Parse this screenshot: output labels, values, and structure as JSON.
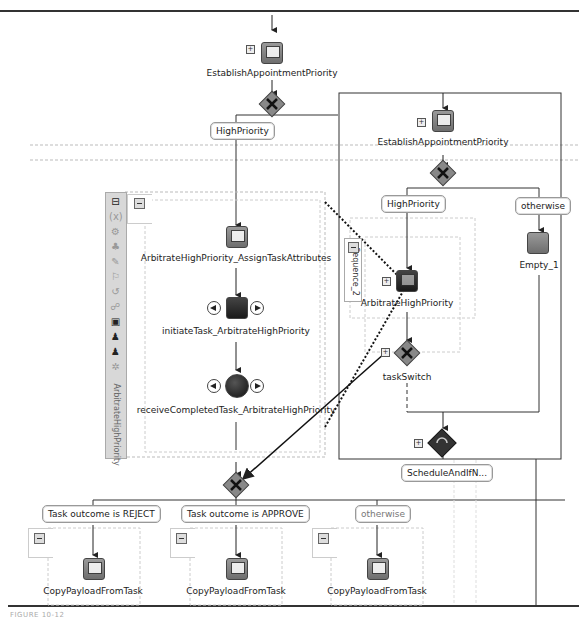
{
  "diagram": {
    "top_activity": {
      "label": "EstablishAppointmentPriority",
      "type": "invoke"
    },
    "top_switch_case": "HighPriority",
    "left_scope": {
      "name": "ArbitrateHighPriority",
      "activities": [
        {
          "label": "ArbitrateHighPriority_AssignTaskAttributes",
          "type": "assign"
        },
        {
          "label": "initiateTask_ArbitrateHighPriority",
          "type": "invoke"
        },
        {
          "label": "receiveCompletedTask_ArbitrateHighPriority",
          "type": "receive"
        }
      ],
      "toolbar_icons": [
        "collapse-icon",
        "variables-icon",
        "correlation-icon",
        "partner-links-icon",
        "message-exchange-icon",
        "fault-handlers-icon",
        "compensation-icon",
        "event-handlers-icon",
        "termination-icon",
        "human-task-icon",
        "human-task-alt-icon",
        "settings-icon"
      ]
    },
    "right_scope": {
      "activity": {
        "label": "EstablishAppointmentPriority",
        "type": "invoke"
      },
      "cases": [
        "HighPriority",
        "otherwise"
      ],
      "sequence": {
        "name": "Sequence_2",
        "activities": [
          {
            "label": "ArbitrateHighPriority",
            "type": "human-task"
          },
          {
            "label": "taskSwitch",
            "type": "switch"
          }
        ]
      },
      "otherwise_activity": {
        "label": "Empty_1",
        "type": "empty"
      },
      "bottom_activity": {
        "label": "ScheduleAndIfN...",
        "type": "while"
      }
    },
    "bottom_switch": {
      "cases": [
        {
          "label": "Task outcome is REJECT",
          "activity": "CopyPayloadFromTask",
          "muted": false
        },
        {
          "label": "Task outcome is APPROVE",
          "activity": "CopyPayloadFromTask",
          "muted": false
        },
        {
          "label": "otherwise",
          "activity": "CopyPayloadFromTask",
          "muted": true
        }
      ]
    },
    "caption": "FIGURE 10-12"
  }
}
